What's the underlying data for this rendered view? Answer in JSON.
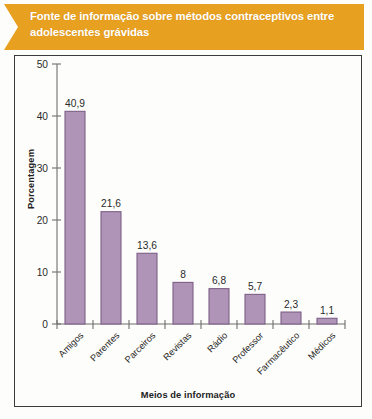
{
  "banner": {
    "title": "Fonte de informação sobre métodos contraceptivos entre adolescentes grávidas",
    "color": "#e8a020",
    "text_color": "#ffffff"
  },
  "chart_data": {
    "type": "bar",
    "title": "Fonte de informação sobre métodos contraceptivos entre adolescentes grávidas",
    "xlabel": "Meios de informação",
    "ylabel": "Porcentagem",
    "ylim": [
      0,
      50
    ],
    "yticks": [
      0,
      10,
      20,
      30,
      40,
      50
    ],
    "ytick_labels": [
      "0",
      "10",
      "20",
      "30",
      "40",
      "50"
    ],
    "grid": false,
    "legend": "none",
    "bar_color": "#b094b8",
    "bar_edge_color": "#7e5f87",
    "categories": [
      "Amigos",
      "Parentes",
      "Parceiros",
      "Revistas",
      "Rádio",
      "Professor",
      "Farmacêutico",
      "Médicos"
    ],
    "values": [
      40.9,
      21.6,
      13.6,
      8,
      6.8,
      5.7,
      2.3,
      1.1
    ],
    "value_labels": [
      "40,9",
      "21,6",
      "13,6",
      "8",
      "6,8",
      "5,7",
      "2,3",
      "1,1"
    ]
  }
}
